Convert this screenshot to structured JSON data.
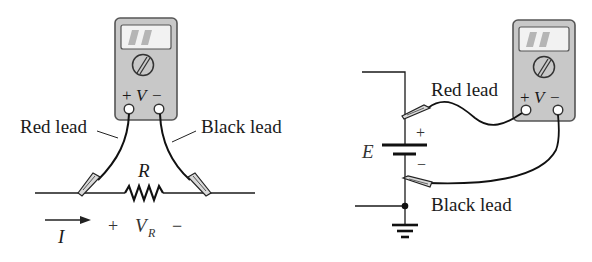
{
  "figure": {
    "left_panel": {
      "meter": {
        "terminal_plus": "+",
        "terminal_label": "V",
        "terminal_minus": "−"
      },
      "labels": {
        "red_lead": "Red lead",
        "black_lead": "Black lead"
      },
      "component": {
        "resistor_label": "R"
      },
      "current": {
        "label": "I"
      },
      "voltage": {
        "plus": "+",
        "label": "V",
        "subscript": "R",
        "minus": "−"
      }
    },
    "right_panel": {
      "meter": {
        "terminal_plus": "+",
        "terminal_label": "V",
        "terminal_minus": "−"
      },
      "labels": {
        "red_lead": "Red lead",
        "black_lead": "Black lead"
      },
      "battery": {
        "label": "E",
        "plus": "+",
        "minus": "−"
      }
    },
    "colors": {
      "meter_body": "#c8c8c8",
      "meter_outline": "#555555",
      "display": "#f2f2f2",
      "display_digits": "#b5b5b5",
      "wire": "#1a1a1a",
      "lead": "#111111",
      "clip_fill": "#d9d9d9"
    }
  }
}
